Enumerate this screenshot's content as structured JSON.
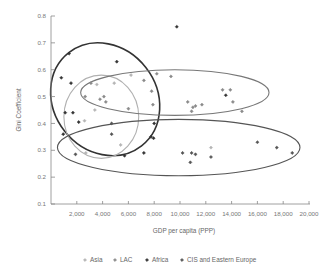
{
  "chart_data": {
    "type": "scatter",
    "title": "",
    "xlabel": "GDP per capita (PPP)",
    "ylabel": "Gini Coefficient",
    "xlim": [
      0,
      20000
    ],
    "ylim": [
      0.1,
      0.8
    ],
    "x_ticks": [
      2000,
      4000,
      6000,
      8000,
      10000,
      12000,
      14000,
      16000,
      18000,
      20000
    ],
    "x_tick_labels": [
      "2,000",
      "4,000",
      "6,000",
      "8,000",
      "10,000",
      "12,000",
      "14,000",
      "16,000",
      "18,000",
      "20,000"
    ],
    "y_ticks": [
      0.1,
      0.2,
      0.3,
      0.4,
      0.5,
      0.6,
      0.7,
      0.8
    ],
    "y_tick_labels": [
      "0.1",
      "0.2",
      "0.3",
      "0.4",
      "0.5",
      "0.6",
      "0.7",
      "0.8"
    ],
    "grid": false,
    "legend_position": "bottom",
    "series": [
      {
        "name": "Asia",
        "color": "#b5b5b5",
        "points": [
          [
            3550,
            0.545
          ],
          [
            3400,
            0.45
          ],
          [
            2600,
            0.41
          ],
          [
            2700,
            0.29
          ],
          [
            5400,
            0.32
          ],
          [
            6200,
            0.58
          ],
          [
            4900,
            0.55
          ],
          [
            12400,
            0.31
          ]
        ]
      },
      {
        "name": "LAC",
        "color": "#8a8a8a",
        "points": [
          [
            2650,
            0.5
          ],
          [
            3800,
            0.49
          ],
          [
            4100,
            0.5
          ],
          [
            4250,
            0.48
          ],
          [
            6000,
            0.455
          ],
          [
            3100,
            0.55
          ],
          [
            7200,
            0.56
          ],
          [
            8200,
            0.585
          ],
          [
            9300,
            0.575
          ],
          [
            7800,
            0.52
          ],
          [
            7900,
            0.47
          ],
          [
            10600,
            0.48
          ],
          [
            11000,
            0.46
          ],
          [
            11200,
            0.465
          ],
          [
            10900,
            0.445
          ],
          [
            11700,
            0.47
          ],
          [
            13300,
            0.525
          ],
          [
            13900,
            0.525
          ],
          [
            14100,
            0.48
          ],
          [
            14800,
            0.445
          ]
        ]
      },
      {
        "name": "Africa",
        "color": "#333333",
        "points": [
          [
            1400,
            0.66
          ],
          [
            800,
            0.57
          ],
          [
            1550,
            0.55
          ],
          [
            5100,
            0.63
          ],
          [
            1100,
            0.44
          ],
          [
            1700,
            0.44
          ],
          [
            2150,
            0.405
          ],
          [
            950,
            0.36
          ],
          [
            7750,
            0.35
          ],
          [
            8000,
            0.4
          ],
          [
            7950,
            0.345
          ],
          [
            9750,
            0.76
          ],
          [
            13550,
            0.505
          ],
          [
            5700,
            0.28
          ],
          [
            7200,
            0.29
          ]
        ]
      },
      {
        "name": "CIS and Eastern Europe",
        "color": "#555555",
        "points": [
          [
            1900,
            0.285
          ],
          [
            4700,
            0.4
          ],
          [
            4700,
            0.36
          ],
          [
            10200,
            0.29
          ],
          [
            10900,
            0.29
          ],
          [
            11200,
            0.285
          ],
          [
            10800,
            0.255
          ],
          [
            12400,
            0.275
          ],
          [
            16000,
            0.33
          ],
          [
            17500,
            0.31
          ],
          [
            18700,
            0.29
          ]
        ]
      }
    ],
    "ellipses": [
      {
        "group": "Africa",
        "color": "#333333",
        "cx": 4200,
        "cy": 0.49,
        "rx": 4000,
        "ry": 0.22,
        "angle_deg": -38
      },
      {
        "group": "Asia",
        "color": "#b0b0b0",
        "cx": 3900,
        "cy": 0.425,
        "rx": 2900,
        "ry": 0.155,
        "angle_deg": 0
      },
      {
        "group": "LAC",
        "color": "#777777",
        "cx": 9600,
        "cy": 0.515,
        "rx": 7300,
        "ry": 0.085,
        "angle_deg": 0
      },
      {
        "group": "CIS and Eastern Europe",
        "color": "#555555",
        "cx": 9900,
        "cy": 0.31,
        "rx": 9400,
        "ry": 0.105,
        "angle_deg": 0
      }
    ],
    "legend": [
      "Asia",
      "LAC",
      "Africa",
      "CIS and Eastern Europe"
    ]
  }
}
